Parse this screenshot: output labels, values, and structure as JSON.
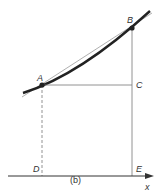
{
  "labels": {
    "A": "A",
    "B": "B",
    "C": "C",
    "D": "D",
    "E": "E",
    "x_axis": "x"
  },
  "caption": "(b)",
  "colors": {
    "curve": "#222222",
    "secant": "#888888",
    "lines": "#666666",
    "axis": "#333333"
  }
}
